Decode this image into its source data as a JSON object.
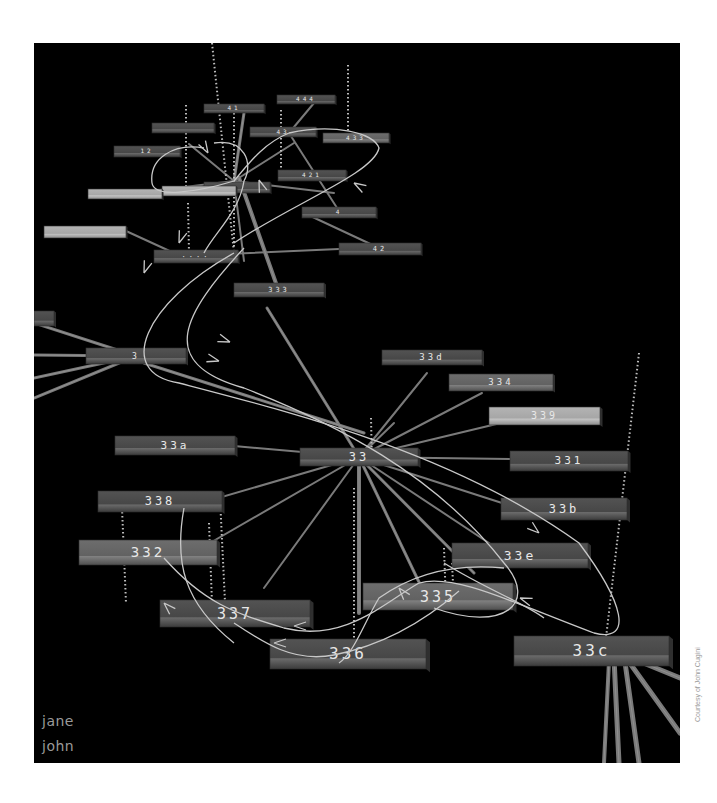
{
  "figure": {
    "credit": "Courtesy of John Cugini",
    "background": "#000000",
    "frame": {
      "x": 34,
      "y": 43,
      "w": 646,
      "h": 720
    }
  },
  "legend": {
    "items": [
      {
        "label": "jane"
      },
      {
        "label": "john"
      }
    ]
  },
  "colors": {
    "bar_dark": "#4a4a4a",
    "bar_mid": "#5e5e5e",
    "bar_light": "#a8a8a8",
    "bar_edge": "#2e2e2e",
    "spoke": "#7a7a7a",
    "curve": "#c8c8c8",
    "dotted": "#bdbdbd",
    "label": "#e8e8e8"
  },
  "nodes": [
    {
      "id": "33",
      "label": "33",
      "x": 266,
      "y": 405,
      "w": 118,
      "h": 18,
      "shade": "dark",
      "fs": 12
    },
    {
      "id": "33d",
      "label": "33d",
      "x": 348,
      "y": 307,
      "w": 100,
      "h": 15,
      "shade": "dark",
      "fs": 9
    },
    {
      "id": "334",
      "label": "334",
      "x": 415,
      "y": 331,
      "w": 104,
      "h": 17,
      "shade": "mid",
      "fs": 9
    },
    {
      "id": "339",
      "label": "339",
      "x": 455,
      "y": 364,
      "w": 111,
      "h": 18,
      "shade": "light",
      "fs": 10
    },
    {
      "id": "33a",
      "label": "33a",
      "x": 81,
      "y": 393,
      "w": 120,
      "h": 19,
      "shade": "dark",
      "fs": 11
    },
    {
      "id": "331",
      "label": "331",
      "x": 476,
      "y": 408,
      "w": 118,
      "h": 20,
      "shade": "dark",
      "fs": 11
    },
    {
      "id": "338",
      "label": "338",
      "x": 64,
      "y": 448,
      "w": 124,
      "h": 21,
      "shade": "dark",
      "fs": 12
    },
    {
      "id": "33b",
      "label": "33b",
      "x": 467,
      "y": 455,
      "w": 126,
      "h": 22,
      "shade": "dark",
      "fs": 12
    },
    {
      "id": "332",
      "label": "332",
      "x": 45,
      "y": 497,
      "w": 138,
      "h": 25,
      "shade": "mid",
      "fs": 14
    },
    {
      "id": "33e",
      "label": "33e",
      "x": 418,
      "y": 500,
      "w": 136,
      "h": 25,
      "shade": "dark",
      "fs": 13
    },
    {
      "id": "335",
      "label": "335",
      "x": 329,
      "y": 540,
      "w": 150,
      "h": 27,
      "shade": "mid",
      "fs": 15
    },
    {
      "id": "337",
      "label": "337",
      "x": 126,
      "y": 557,
      "w": 150,
      "h": 27,
      "shade": "dark",
      "fs": 15
    },
    {
      "id": "336",
      "label": "336",
      "x": 236,
      "y": 596,
      "w": 156,
      "h": 30,
      "shade": "dark",
      "fs": 16
    },
    {
      "id": "33c",
      "label": "33c",
      "x": 480,
      "y": 593,
      "w": 155,
      "h": 30,
      "shade": "dark",
      "fs": 16
    },
    {
      "id": "333",
      "label": "333",
      "x": 200,
      "y": 240,
      "w": 90,
      "h": 14,
      "shade": "dark",
      "fs": 7
    },
    {
      "id": "3",
      "label": "3",
      "x": 52,
      "y": 305,
      "w": 100,
      "h": 16,
      "shade": "dark",
      "fs": 8
    },
    {
      "id": "3a",
      "label": "",
      "x": 0,
      "y": 268,
      "w": 20,
      "h": 15,
      "shade": "dark",
      "fs": 7
    },
    {
      "id": "hub2",
      "label": "····",
      "x": 120,
      "y": 207,
      "w": 84,
      "h": 13,
      "shade": "dark",
      "fs": 7
    },
    {
      "id": "n42",
      "label": "42",
      "x": 305,
      "y": 200,
      "w": 82,
      "h": 12,
      "shade": "dark",
      "fs": 7
    },
    {
      "id": "n4",
      "label": "4",
      "x": 268,
      "y": 164,
      "w": 74,
      "h": 11,
      "shade": "dark",
      "fs": 6
    },
    {
      "id": "n421",
      "label": "421",
      "x": 244,
      "y": 127,
      "w": 68,
      "h": 11,
      "shade": "dark",
      "fs": 6
    },
    {
      "id": "hub3",
      "label": "",
      "x": 170,
      "y": 139,
      "w": 66,
      "h": 11,
      "shade": "dark",
      "fs": 6
    },
    {
      "id": "n422",
      "label": "",
      "x": 128,
      "y": 143,
      "w": 74,
      "h": 10,
      "shade": "light",
      "fs": 6
    },
    {
      "id": "n12",
      "label": "12",
      "x": 80,
      "y": 103,
      "w": 66,
      "h": 11,
      "shade": "dark",
      "fs": 6
    },
    {
      "id": "n4a",
      "label": "",
      "x": 118,
      "y": 80,
      "w": 62,
      "h": 10,
      "shade": "dark",
      "fs": 6
    },
    {
      "id": "n41",
      "label": "41",
      "x": 170,
      "y": 61,
      "w": 60,
      "h": 9,
      "shade": "dark",
      "fs": 6
    },
    {
      "id": "n444",
      "label": "444",
      "x": 243,
      "y": 52,
      "w": 58,
      "h": 9,
      "shade": "dark",
      "fs": 6
    },
    {
      "id": "n43",
      "label": "43",
      "x": 216,
      "y": 84,
      "w": 66,
      "h": 10,
      "shade": "dark",
      "fs": 6
    },
    {
      "id": "n433",
      "label": "433",
      "x": 289,
      "y": 90,
      "w": 66,
      "h": 10,
      "shade": "mid",
      "fs": 6
    },
    {
      "id": "nL1",
      "label": "",
      "x": 10,
      "y": 183,
      "w": 82,
      "h": 12,
      "shade": "light",
      "fs": 6
    },
    {
      "id": "nL2",
      "label": "",
      "x": 54,
      "y": 146,
      "w": 74,
      "h": 10,
      "shade": "light",
      "fs": 6
    }
  ],
  "spokes": [
    {
      "from": [
        325,
        414
      ],
      "to": [
        233,
        265
      ],
      "w": 3
    },
    {
      "from": [
        325,
        414
      ],
      "to": [
        393,
        330
      ],
      "w": 2
    },
    {
      "from": [
        325,
        414
      ],
      "to": [
        448,
        350
      ],
      "w": 2
    },
    {
      "from": [
        325,
        414
      ],
      "to": [
        475,
        378
      ],
      "w": 2
    },
    {
      "from": [
        325,
        414
      ],
      "to": [
        200,
        403
      ],
      "w": 2
    },
    {
      "from": [
        325,
        414
      ],
      "to": [
        476,
        416
      ],
      "w": 2
    },
    {
      "from": [
        325,
        414
      ],
      "to": [
        468,
        460
      ],
      "w": 2
    },
    {
      "from": [
        325,
        414
      ],
      "to": [
        150,
        465
      ],
      "w": 2
    },
    {
      "from": [
        325,
        414
      ],
      "to": [
        150,
        515
      ],
      "w": 2
    },
    {
      "from": [
        325,
        414
      ],
      "to": [
        230,
        545
      ],
      "w": 2
    },
    {
      "from": [
        325,
        414
      ],
      "to": [
        325,
        570
      ],
      "w": 4
    },
    {
      "from": [
        325,
        414
      ],
      "to": [
        395,
        560
      ],
      "w": 3
    },
    {
      "from": [
        325,
        414
      ],
      "to": [
        440,
        530
      ],
      "w": 3
    },
    {
      "from": [
        325,
        414
      ],
      "to": [
        470,
        510
      ],
      "w": 2
    },
    {
      "from": [
        325,
        414
      ],
      "to": [
        360,
        380
      ],
      "w": 2
    },
    {
      "from": [
        102,
        313
      ],
      "to": [
        0,
        280
      ],
      "w": 3
    },
    {
      "from": [
        102,
        313
      ],
      "to": [
        0,
        312
      ],
      "w": 3
    },
    {
      "from": [
        102,
        313
      ],
      "to": [
        0,
        335
      ],
      "w": 3
    },
    {
      "from": [
        102,
        313
      ],
      "to": [
        0,
        355
      ],
      "w": 3
    },
    {
      "from": [
        110,
        320
      ],
      "to": [
        330,
        390
      ],
      "w": 3
    },
    {
      "from": [
        590,
        612
      ],
      "to": [
        646,
        635
      ],
      "w": 5
    },
    {
      "from": [
        590,
        612
      ],
      "to": [
        646,
        690
      ],
      "w": 5
    },
    {
      "from": [
        590,
        612
      ],
      "to": [
        605,
        720
      ],
      "w": 5
    },
    {
      "from": [
        580,
        615
      ],
      "to": [
        585,
        720
      ],
      "w": 5
    },
    {
      "from": [
        575,
        618
      ],
      "to": [
        570,
        720
      ],
      "w": 4
    },
    {
      "from": [
        200,
        138
      ],
      "to": [
        155,
        101
      ],
      "w": 2
    },
    {
      "from": [
        200,
        138
      ],
      "to": [
        126,
        147
      ],
      "w": 2
    },
    {
      "from": [
        200,
        138
      ],
      "to": [
        210,
        70
      ],
      "w": 3
    },
    {
      "from": [
        200,
        138
      ],
      "to": [
        260,
        100
      ],
      "w": 2
    },
    {
      "from": [
        200,
        138
      ],
      "to": [
        300,
        150
      ],
      "w": 2
    },
    {
      "from": [
        200,
        138
      ],
      "to": [
        210,
        218
      ],
      "w": 2
    },
    {
      "from": [
        255,
        90
      ],
      "to": [
        280,
        60
      ],
      "w": 2
    },
    {
      "from": [
        255,
        90
      ],
      "to": [
        305,
        168
      ],
      "w": 2
    },
    {
      "from": [
        270,
        170
      ],
      "to": [
        345,
        205
      ],
      "w": 2
    },
    {
      "from": [
        170,
        212
      ],
      "to": [
        305,
        206
      ],
      "w": 2
    },
    {
      "from": [
        205,
        135
      ],
      "to": [
        244,
        246
      ],
      "w": 4
    },
    {
      "from": [
        92,
        188
      ],
      "to": [
        140,
        210
      ],
      "w": 2
    },
    {
      "from": [
        128,
        148
      ],
      "to": [
        170,
        145
      ],
      "w": 2
    }
  ],
  "dotted": [
    {
      "from": [
        178,
        0
      ],
      "to": [
        200,
        210
      ]
    },
    {
      "from": [
        314,
        22
      ],
      "to": [
        314,
        95
      ]
    },
    {
      "from": [
        152,
        62
      ],
      "to": [
        152,
        150
      ]
    },
    {
      "from": [
        247,
        67
      ],
      "to": [
        247,
        138
      ]
    },
    {
      "from": [
        200,
        70
      ],
      "to": [
        200,
        205
      ]
    },
    {
      "from": [
        154,
        160
      ],
      "to": [
        155,
        210
      ]
    },
    {
      "from": [
        337,
        375
      ],
      "to": [
        338,
        420
      ]
    },
    {
      "from": [
        88,
        465
      ],
      "to": [
        92,
        560
      ]
    },
    {
      "from": [
        186,
        455
      ],
      "to": [
        192,
        580
      ]
    },
    {
      "from": [
        175,
        480
      ],
      "to": [
        178,
        560
      ]
    },
    {
      "from": [
        320,
        445
      ],
      "to": [
        320,
        600
      ]
    },
    {
      "from": [
        605,
        310
      ],
      "to": [
        572,
        595
      ]
    },
    {
      "from": [
        410,
        505
      ],
      "to": [
        412,
        560
      ]
    },
    {
      "from": [
        418,
        520
      ],
      "to": [
        420,
        560
      ]
    }
  ],
  "curves": [
    {
      "d": "M 200 210 C 110 260, 80 330, 145 340 C 260 370, 420 410, 545 500 C 590 560, 600 600, 560 590 C 480 560, 420 530, 385 540"
    },
    {
      "d": "M 210 205 C 150 270, 120 320, 210 345 C 300 380, 400 430, 470 520 C 505 560, 470 590, 400 565"
    },
    {
      "d": "M 385 540 C 350 560, 310 600, 250 585 C 200 570, 170 560, 130 515"
    },
    {
      "d": "M 425 548 C 400 570, 360 600, 300 612 C 260 620, 230 600, 200 580"
    },
    {
      "d": "M 470 525 C 420 520, 380 530, 345 555 C 330 580, 320 610, 305 620"
    },
    {
      "d": "M 170 105 C 140 100, 115 115, 118 140 C 120 155, 160 150, 200 138 C 215 120, 230 100, 255 90"
    },
    {
      "d": "M 255 90 C 300 80, 340 90, 345 105 C 340 130, 260 160, 200 200"
    },
    {
      "d": "M 180 100 C 210 95, 220 120, 210 138 C 205 170, 180 190, 170 210"
    },
    {
      "d": "M 410 520 C 450 545, 490 560, 510 575"
    },
    {
      "d": "M 150 465 C 140 520, 150 560, 200 600"
    }
  ],
  "arrows": [
    {
      "x": 196,
      "y": 299,
      "angle": 20
    },
    {
      "x": 185,
      "y": 318,
      "angle": 15
    },
    {
      "x": 505,
      "y": 490,
      "angle": 40
    },
    {
      "x": 486,
      "y": 555,
      "angle": 200
    },
    {
      "x": 130,
      "y": 560,
      "angle": 225
    },
    {
      "x": 260,
      "y": 583,
      "angle": 180
    },
    {
      "x": 240,
      "y": 600,
      "angle": 180
    },
    {
      "x": 365,
      "y": 545,
      "angle": 230
    },
    {
      "x": 145,
      "y": 200,
      "angle": 110
    },
    {
      "x": 110,
      "y": 230,
      "angle": 110
    },
    {
      "x": 174,
      "y": 110,
      "angle": 60
    },
    {
      "x": 225,
      "y": 137,
      "angle": 250
    },
    {
      "x": 320,
      "y": 140,
      "angle": 210
    }
  ]
}
